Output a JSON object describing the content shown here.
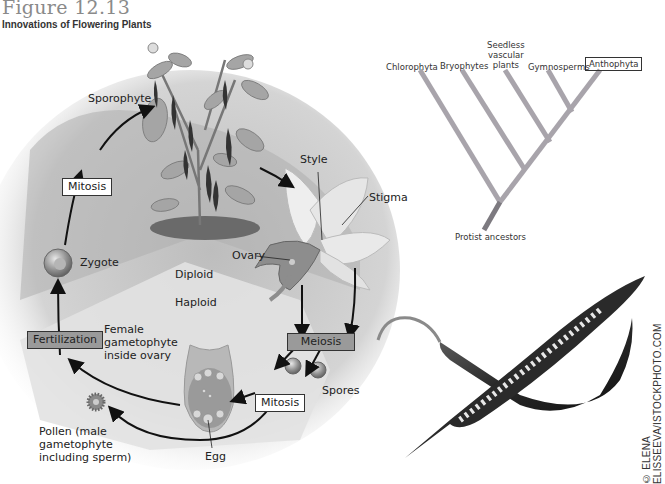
{
  "figure": {
    "number": "Figure 12.13",
    "title": "Innovations of Flowering Plants"
  },
  "life_cycle": {
    "labels": {
      "sporophyte": "Sporophyte",
      "style": "Style",
      "stigma": "Stigma",
      "ovary": "Ovary",
      "zygote": "Zygote",
      "diploid": "Diploid",
      "haploid": "Haploid",
      "female_gametophyte": [
        "Female",
        "gametophyte",
        "inside ovary"
      ],
      "spores": "Spores",
      "pollen": [
        "Pollen (male",
        "gametophyte",
        "including sperm)"
      ],
      "egg": "Egg"
    },
    "process_boxes": {
      "mitosis_top": "Mitosis",
      "fertilization": "Fertilization",
      "meiosis": "Meiosis",
      "mitosis_bottom": "Mitosis"
    },
    "icons": [
      "pepper-plant-icon",
      "flower-icon",
      "zygote-cell-icon",
      "spore-icon",
      "ovule-icon",
      "pollen-grain-icon"
    ]
  },
  "cladogram": {
    "taxa": [
      "Chlorophyta",
      "Bryophytes",
      "Seedless vascular plants",
      "Gymnosperms",
      "Anthophyta"
    ],
    "taxa_lines": {
      "seedless": [
        "Seedless",
        "vascular",
        "plants"
      ]
    },
    "highlighted": "Anthophyta",
    "root_label": "Protist ancestors",
    "branch_color": "#a8a4ab"
  },
  "photo": {
    "subject": "Chili peppers (one sliced open showing seeds)",
    "credit": "© ELENA ELISSEEVA/ISTOCKPHOTO.COM"
  },
  "colors": {
    "diploid_zone": "#a9a9a9",
    "haploid_zone": "#dedede",
    "dark_box": "#9a9a9a",
    "arrow": "#111111"
  }
}
